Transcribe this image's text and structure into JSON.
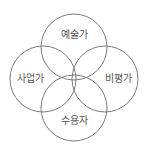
{
  "diagram": {
    "type": "venn",
    "stroke_color": "#7a7a7a",
    "text_color": "#555555",
    "circles": [
      {
        "id": "top",
        "label": "예술가",
        "cx": 74,
        "cy": 47,
        "r": 33,
        "label_x": 74,
        "label_y": 38
      },
      {
        "id": "left",
        "label": "사업가",
        "cx": 43,
        "cy": 79,
        "r": 33,
        "label_x": 30,
        "label_y": 82
      },
      {
        "id": "right",
        "label": "비평가",
        "cx": 105,
        "cy": 79,
        "r": 33,
        "label_x": 118,
        "label_y": 82
      },
      {
        "id": "bottom",
        "label": "수용자",
        "cx": 74,
        "cy": 108,
        "r": 33,
        "label_x": 74,
        "label_y": 124
      }
    ]
  }
}
